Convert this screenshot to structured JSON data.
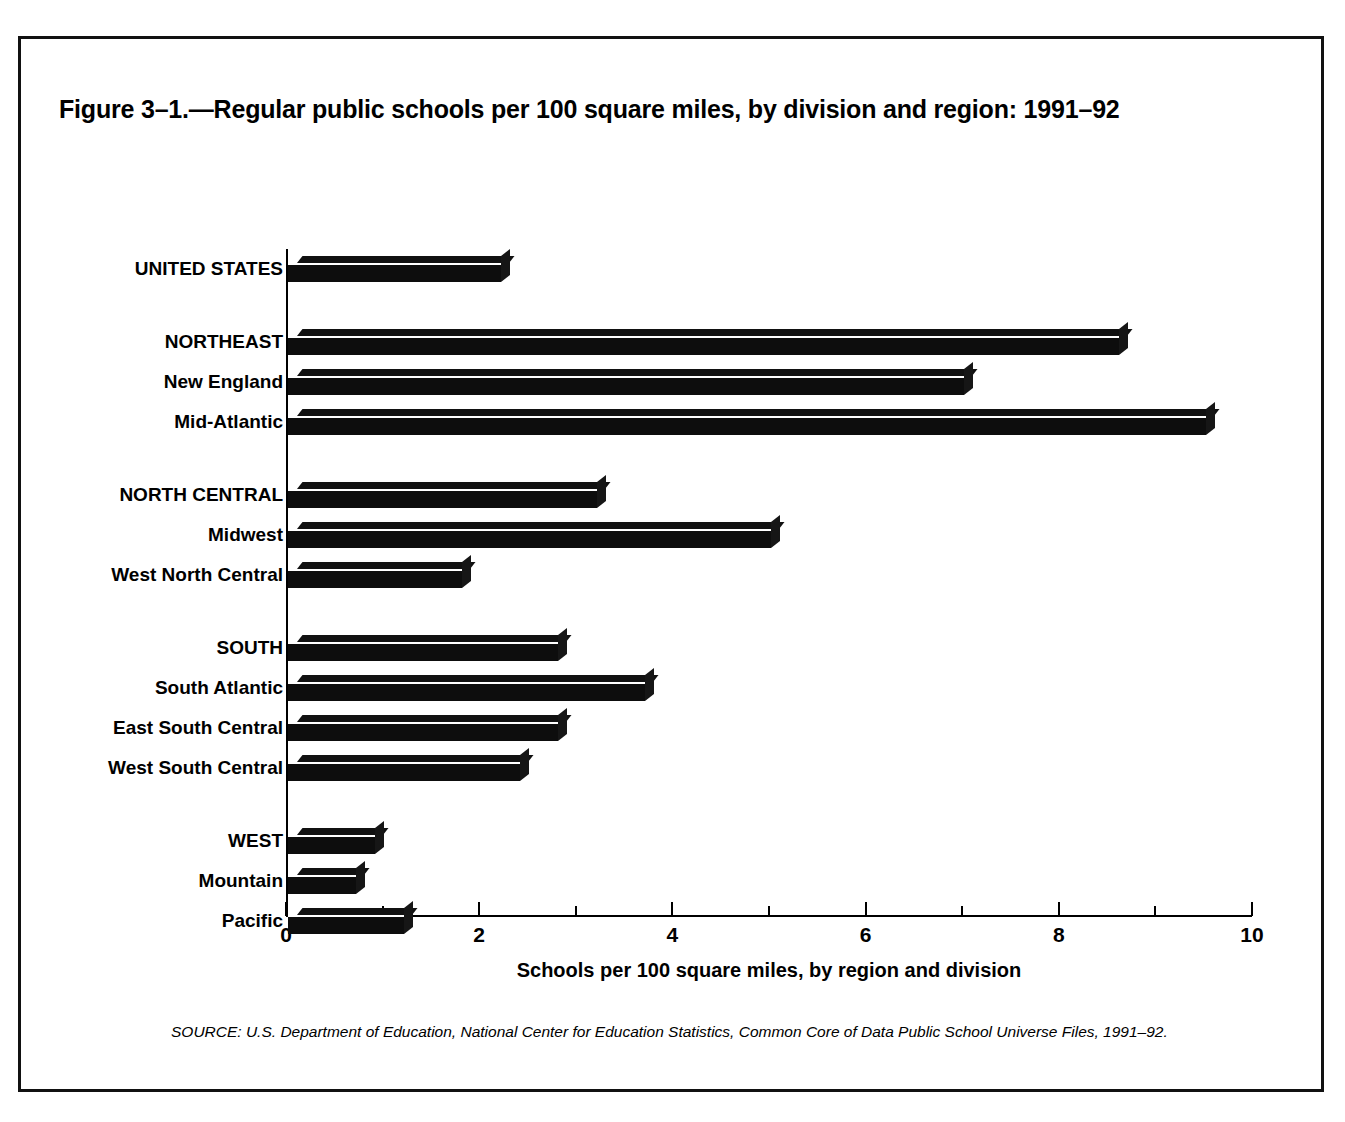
{
  "figure": {
    "title": "Figure 3–1.—Regular public schools per 100 square miles, by division and region: 1991–92",
    "source_note": "SOURCE: U.S. Department of Education, National Center for Education Statistics, Common Core of Data Public School Universe Files, 1991–92.",
    "frame_color": "#111111",
    "bar_color": "#0d0d0d",
    "background": "#ffffff"
  },
  "chart_data": {
    "type": "bar",
    "orientation": "horizontal",
    "title": "Figure 3–1.—Regular public schools per 100 square miles, by division and region: 1991–92",
    "xlabel": "Schools per 100 square miles, by region and division",
    "ylabel": "",
    "xlim": [
      0,
      10
    ],
    "xticks": [
      0,
      2,
      4,
      6,
      8,
      10
    ],
    "xtick_labels": [
      "0",
      "2",
      "4",
      "6",
      "8",
      "10"
    ],
    "xticks_minor": [
      1,
      3,
      5,
      7,
      9
    ],
    "grid": false,
    "legend": false,
    "categories": [
      "UNITED STATES",
      "NORTHEAST",
      "New England",
      "Mid-Atlantic",
      "NORTH CENTRAL",
      "Midwest",
      "West North Central",
      "SOUTH",
      "South Atlantic",
      "East South Central",
      "West South Central",
      "WEST",
      "Mountain",
      "Pacific"
    ],
    "values": [
      2.2,
      8.6,
      7.0,
      9.5,
      3.2,
      5.0,
      1.8,
      2.8,
      3.7,
      2.8,
      2.4,
      0.9,
      0.7,
      1.2
    ],
    "rows": [
      {
        "label": "UNITED STATES",
        "value": 2.2,
        "group": "national",
        "emphasis": "bold"
      },
      {
        "label": "NORTHEAST",
        "value": 8.6,
        "group": "northeast",
        "emphasis": "bold"
      },
      {
        "label": "New England",
        "value": 7.0,
        "group": "northeast",
        "emphasis": "normal"
      },
      {
        "label": "Mid-Atlantic",
        "value": 9.5,
        "group": "northeast",
        "emphasis": "normal"
      },
      {
        "label": "NORTH CENTRAL",
        "value": 3.2,
        "group": "north-central",
        "emphasis": "bold"
      },
      {
        "label": "Midwest",
        "value": 5.0,
        "group": "north-central",
        "emphasis": "normal"
      },
      {
        "label": "West North Central",
        "value": 1.8,
        "group": "north-central",
        "emphasis": "normal"
      },
      {
        "label": "SOUTH",
        "value": 2.8,
        "group": "south",
        "emphasis": "bold"
      },
      {
        "label": "South Atlantic",
        "value": 3.7,
        "group": "south",
        "emphasis": "normal"
      },
      {
        "label": "East South Central",
        "value": 2.8,
        "group": "south",
        "emphasis": "normal"
      },
      {
        "label": "West South Central",
        "value": 2.4,
        "group": "south",
        "emphasis": "normal"
      },
      {
        "label": "WEST",
        "value": 0.9,
        "group": "west",
        "emphasis": "bold"
      },
      {
        "label": "Mountain",
        "value": 0.7,
        "group": "west",
        "emphasis": "normal"
      },
      {
        "label": "Pacific",
        "value": 1.2,
        "group": "west",
        "emphasis": "normal"
      }
    ]
  }
}
